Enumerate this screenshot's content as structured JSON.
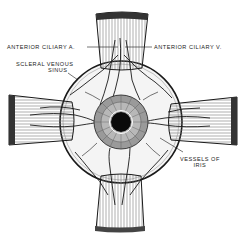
{
  "figure": {
    "colors": {
      "ink": "#1a1a1a",
      "background": "#ffffff",
      "muscle_shade": "#cfcfcf"
    },
    "labels": [
      {
        "id": "anterior-ciliary-a",
        "text": "ANTERIOR CILIARY A."
      },
      {
        "id": "anterior-ciliary-v",
        "text": "ANTERIOR CILIARY V."
      },
      {
        "id": "scleral-venous-sinus",
        "line1": "SCLERAL VENOUS",
        "line2": "SINUS"
      },
      {
        "id": "vessels-of-iris",
        "line1": "VESSELS OF",
        "line2": "IRIS"
      }
    ]
  }
}
